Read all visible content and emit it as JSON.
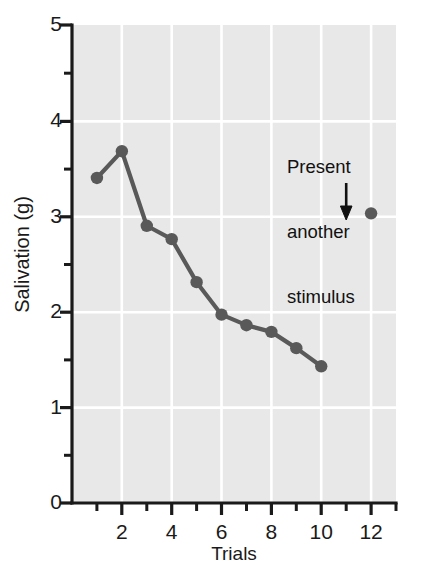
{
  "chart_data": {
    "type": "line",
    "title": "",
    "xlabel": "Trials",
    "ylabel": "Salivation (g)",
    "xlim": [
      0,
      13
    ],
    "ylim": [
      0,
      5
    ],
    "grid": true,
    "legend": "none",
    "x_major_ticks": [
      2,
      4,
      6,
      8,
      10,
      12
    ],
    "x_minor_ticks": [
      1,
      3,
      5,
      7,
      9,
      11,
      13
    ],
    "x_tick_labels": [
      "2",
      "4",
      "6",
      "8",
      "10",
      "12"
    ],
    "y_major_ticks": [
      0,
      1,
      2,
      3,
      4,
      5
    ],
    "y_minor_ticks": [
      0.5,
      1.5,
      2.5,
      3.5,
      4.5
    ],
    "y_tick_labels": [
      "5",
      "4",
      "3",
      "2",
      "1",
      "0"
    ],
    "series": [
      {
        "name": "Acquisition / extinction curve",
        "connected": true,
        "x": [
          1,
          2,
          3,
          4,
          5,
          6,
          7,
          8,
          9,
          10
        ],
        "values": [
          3.4,
          3.68,
          2.9,
          2.76,
          2.31,
          1.97,
          1.86,
          1.79,
          1.62,
          1.43
        ]
      },
      {
        "name": "Spontaneous recovery point",
        "connected": false,
        "x": [
          12
        ],
        "values": [
          3.03
        ]
      }
    ],
    "annotations": [
      {
        "name": "present-another-stimulus",
        "text": "Present\nanother\nstimulus",
        "line1": "Present",
        "line2": "another",
        "line3": "stimulus",
        "arrow": "down-arrow",
        "arrow_x": 11,
        "arrow_y_from": 3.75,
        "arrow_y_to": 3.02
      }
    ],
    "colors": {
      "plot_background": "#e8e8e8",
      "gridline": "#ffffff",
      "data": "#595959",
      "axis": "#1a1a1a",
      "text": "#1a1a1a",
      "page_background": "#ffffff"
    }
  }
}
